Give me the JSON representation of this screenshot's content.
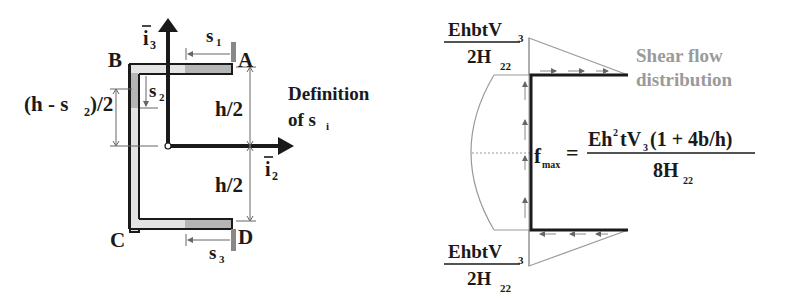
{
  "left_diagram": {
    "title_line1": "Definition",
    "title_line2_main": "of s",
    "title_line2_sub": "i",
    "points": {
      "A": "A",
      "B": "B",
      "C": "C",
      "D": "D"
    },
    "axes": {
      "vertical": {
        "label": "i",
        "sub": "3"
      },
      "horizontal": {
        "label": "i",
        "sub": "2"
      }
    },
    "dimensions": {
      "s1": {
        "main": "s",
        "sub": "1"
      },
      "s2": {
        "main": "s",
        "sub": "2"
      },
      "s3": {
        "main": "s",
        "sub": "3"
      },
      "upper_half": "h/2",
      "lower_half": "h/2",
      "web_dim_pre": "(h - s",
      "web_dim_sub": "2",
      "web_dim_post": ")/2"
    }
  },
  "right_diagram": {
    "label_line1": "Shear flow",
    "label_line2": "distribution",
    "top_value": {
      "num_main": "EhbtV",
      "num_sub": "3",
      "den_main": "2H",
      "den_sub": "22"
    },
    "bottom_value": {
      "num_main": "EhbtV",
      "num_sub": "3",
      "den_main": "2H",
      "den_sub": "22"
    },
    "fmax": {
      "lhs_main": "f",
      "lhs_sub": "max",
      "eq": "=",
      "num_a": "Eh",
      "num_sup": "2",
      "num_b": "tV",
      "num_sub": "3",
      "num_c": "(1 + 4b/h)",
      "den_main": "8H",
      "den_sub": "22"
    }
  },
  "colors": {
    "ink": "#1a1a1a",
    "flange_fill": "#b5b5b5",
    "web_fill": "#e4e4e4",
    "gray_text": "#9a9a9a",
    "thin_line": "#8a8a8a"
  }
}
